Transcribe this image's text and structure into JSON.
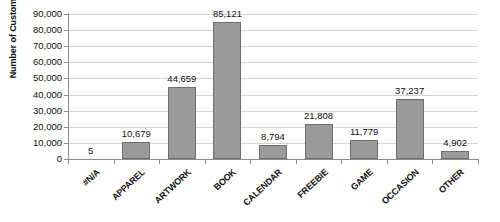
{
  "chart_data": {
    "type": "bar",
    "title": "",
    "xlabel": "",
    "ylabel": "Number of Customers",
    "categories": [
      "#N/A",
      "APPAREL",
      "ARTWORK",
      "BOOK",
      "CALENDAR",
      "FREEBIE",
      "GAME",
      "OCCASION",
      "OTHER"
    ],
    "values": [
      5,
      10679,
      44659,
      85121,
      8794,
      21808,
      11779,
      37237,
      4902
    ],
    "data_labels": [
      "5",
      "10,679",
      "44,659",
      "85,121",
      "8,794",
      "21,808",
      "11,779",
      "37,237",
      "4,902"
    ],
    "ylim": [
      0,
      90000
    ],
    "ytick_values": [
      0,
      10000,
      20000,
      30000,
      40000,
      50000,
      60000,
      70000,
      80000,
      90000
    ],
    "ytick_labels": [
      "0",
      "10,000",
      "20,000",
      "30,000",
      "40,000",
      "50,000",
      "60,000",
      "70,000",
      "80,000",
      "90,000"
    ],
    "grid": true,
    "grid_axis": "y",
    "legend": false,
    "legend_position": "none",
    "bar_color": "#9a9a9a",
    "bar_border_color": "#6e6e6e",
    "gridline_color": "#d4d4d4",
    "axis_color": "#8c8c8c",
    "text_color": "#111111",
    "background": "#ffffff",
    "xlabel_rotation": -43
  }
}
